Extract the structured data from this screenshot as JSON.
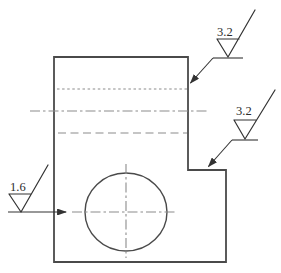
{
  "figure": {
    "type": "engineering-drawing",
    "roughness_callouts": [
      {
        "position": "top-right",
        "value": "3.2",
        "target": "upper right side face"
      },
      {
        "position": "middle-right",
        "value": "3.2",
        "target": "step horizontal face"
      },
      {
        "position": "left",
        "value": "1.6",
        "target": "hole via centerline"
      }
    ],
    "colors": {
      "background": "#ffffff",
      "line": "#4a4a4a",
      "dashed": "#8c8c8c",
      "symbol": "#333333",
      "text": "#2b2b2b"
    }
  }
}
